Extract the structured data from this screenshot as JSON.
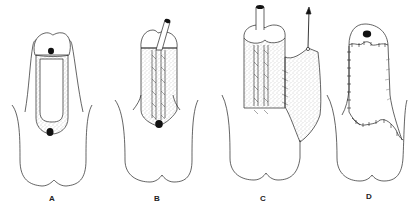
{
  "figure": {
    "panels": [
      {
        "id": "A",
        "label": "A",
        "label_x": 52,
        "label_y": 194
      },
      {
        "id": "B",
        "label": "B",
        "label_x": 157,
        "label_y": 194
      },
      {
        "id": "C",
        "label": "C",
        "label_x": 263,
        "label_y": 194
      },
      {
        "id": "D",
        "label": "D",
        "label_x": 369,
        "label_y": 192
      }
    ],
    "colors": {
      "line": "#222222",
      "stipple": "#9a9a9a",
      "fill_dark": "#111111",
      "background": "#ffffff"
    }
  }
}
